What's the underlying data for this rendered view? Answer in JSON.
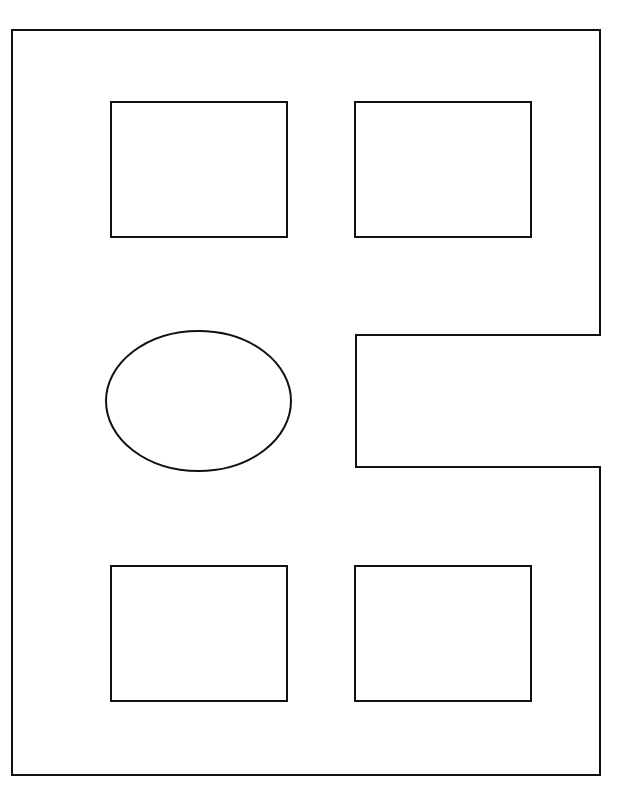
{
  "diagram": {
    "width": 619,
    "height": 793,
    "stroke_color": "#111111",
    "fill_color": "#ffffff",
    "outline_path": "M12,30 L600,30 L600,335 L356,335 L356,467 L600,467 L600,775 L12,775 Z",
    "rectangles": [
      {
        "id": "top-left",
        "x": 111,
        "y": 102,
        "w": 176,
        "h": 135
      },
      {
        "id": "top-right",
        "x": 355,
        "y": 102,
        "w": 176,
        "h": 135
      },
      {
        "id": "bottom-left",
        "x": 111,
        "y": 566,
        "w": 176,
        "h": 135
      },
      {
        "id": "bottom-right",
        "x": 355,
        "y": 566,
        "w": 176,
        "h": 135
      }
    ],
    "ellipse": {
      "cx": 198.5,
      "cy": 401,
      "rx": 92.5,
      "ry": 70
    }
  }
}
